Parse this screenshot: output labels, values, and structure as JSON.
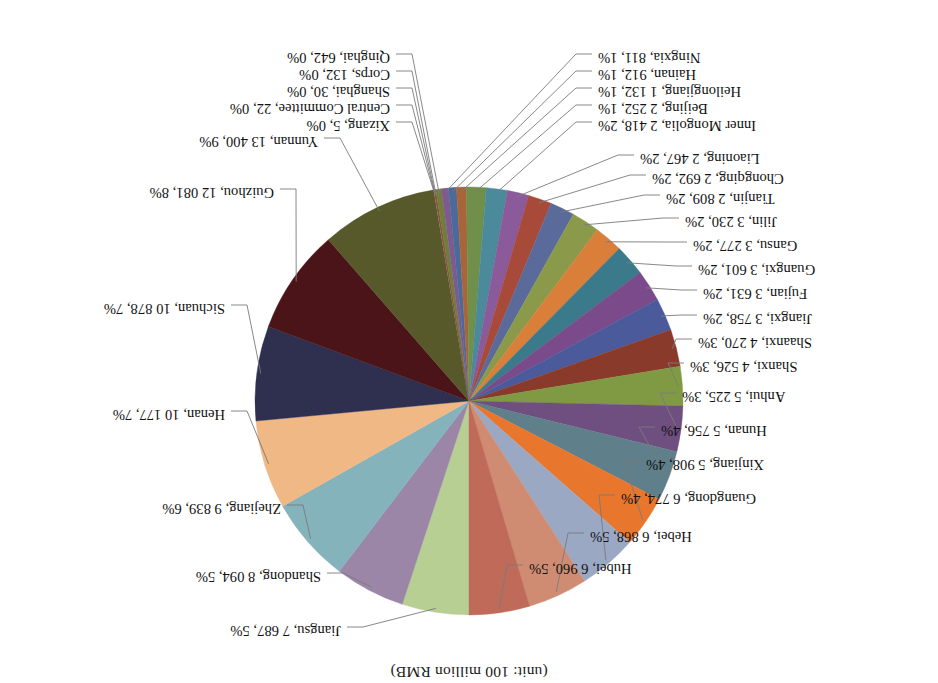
{
  "chart_data": {
    "type": "pie",
    "title": "(unit: 100 million RMB)",
    "xlabel": "",
    "ylabel": "",
    "legend_position": "none",
    "grid": false,
    "rotation_degrees": 180,
    "value_unit": "100 million RMB",
    "categories": [
      "Jiangsu",
      "Shandong",
      "Zhejiang",
      "Henan",
      "Sichuan",
      "Guizhou",
      "Yunnan",
      "Xizang",
      "Central Committee",
      "Shanghai",
      "Corps",
      "Qinghai",
      "Ningxia",
      "Hainan",
      "Heilongjiang",
      "Beijing",
      "Inner Mongolia",
      "Liaoning",
      "Chongqing",
      "Tianjin",
      "Jilin",
      "Gansu",
      "Guangxi",
      "Fujian",
      "Jiangxi",
      "Shaanxi",
      "Shanxi",
      "Anhui",
      "Hunan",
      "Xinjiang",
      "Guangdong",
      "Hebei",
      "Hubei"
    ],
    "values": [
      7687,
      8094,
      9839,
      10177,
      10878,
      12081,
      13400,
      5,
      22,
      30,
      132,
      642,
      811,
      912,
      1132,
      2252,
      2418,
      2467,
      2692,
      2809,
      3230,
      3277,
      3601,
      3631,
      3758,
      4270,
      4526,
      5225,
      5756,
      5908,
      6774,
      6868,
      6960
    ],
    "percents": [
      5,
      5,
      6,
      7,
      7,
      8,
      9,
      0,
      0,
      0,
      0,
      0,
      1,
      1,
      1,
      1,
      2,
      2,
      2,
      2,
      2,
      2,
      2,
      2,
      2,
      3,
      3,
      3,
      4,
      4,
      4,
      5,
      5
    ],
    "colors": [
      "#b8cf93",
      "#9b86a8",
      "#84b3bc",
      "#f0b884",
      "#2f3050",
      "#4a1418",
      "#57592a",
      "#8fb3c4",
      "#f0a64a",
      "#5a4a7a",
      "#a03c32",
      "#6f7f3a",
      "#7f5a8f",
      "#4a6a9a",
      "#a8653a",
      "#6f8f4a",
      "#4a8a9a",
      "#8a5a9a",
      "#a84a3a",
      "#5a6a9a",
      "#8a9a4a",
      "#d97f3a",
      "#3a7a8a",
      "#7a4a8a",
      "#4a5a9a",
      "#8a3a2a",
      "#7f9a42",
      "#6f4f7f",
      "#5f7f8a",
      "#e8762c",
      "#9aa8c4",
      "#d08c72",
      "#c06a5a"
    ],
    "labels": [
      {
        "name": "Jiangsu",
        "value": "7 687",
        "percent": "5%",
        "text": "Jiangsu, 7 687, 5%"
      },
      {
        "name": "Shandong",
        "value": "8 094",
        "percent": "5%",
        "text": "Shandong, 8 094, 5%"
      },
      {
        "name": "Zhejiang",
        "value": "9 839",
        "percent": "6%",
        "text": "Zhejiang, 9 839, 6%"
      },
      {
        "name": "Henan",
        "value": "10 177",
        "percent": "7%",
        "text": "Henan, 10 177, 7%"
      },
      {
        "name": "Sichuan",
        "value": "10 878",
        "percent": "7%",
        "text": "Sichuan, 10 878, 7%"
      },
      {
        "name": "Guizhou",
        "value": "12 081",
        "percent": "8%",
        "text": "Guizhou, 12 081, 8%"
      },
      {
        "name": "Yunnan",
        "value": "13 400",
        "percent": "9%",
        "text": "Yunnan, 13 400, 9%"
      },
      {
        "name": "Xizang",
        "value": "5",
        "percent": "0%",
        "text": "Xizang, 5, 0%"
      },
      {
        "name": "Central Committee",
        "value": "22",
        "percent": "0%",
        "text": "Central Committee, 22, 0%"
      },
      {
        "name": "Shanghai",
        "value": "30",
        "percent": "0%",
        "text": "Shanghai, 30, 0%"
      },
      {
        "name": "Corps",
        "value": "132",
        "percent": "0%",
        "text": "Corps, 132, 0%"
      },
      {
        "name": "Qinghai",
        "value": "642",
        "percent": "0%",
        "text": "Qinghai, 642, 0%"
      },
      {
        "name": "Ningxia",
        "value": "811",
        "percent": "1%",
        "text": "Ningxia, 811, 1%"
      },
      {
        "name": "Hainan",
        "value": "912",
        "percent": "1%",
        "text": "Hainan, 912, 1%"
      },
      {
        "name": "Heilongjiang",
        "value": "1 132",
        "percent": "1%",
        "text": "Heilongjiang, 1 132, 1%"
      },
      {
        "name": "Beijing",
        "value": "2 252",
        "percent": "1%",
        "text": "Beijing, 2 252, 1%"
      },
      {
        "name": "Inner Mongolia",
        "value": "2 418",
        "percent": "2%",
        "text": "Inner Mongolia, 2 418, 2%"
      },
      {
        "name": "Liaoning",
        "value": "2 467",
        "percent": "2%",
        "text": "Liaoning, 2 467, 2%"
      },
      {
        "name": "Chongqing",
        "value": "2 692",
        "percent": "2%",
        "text": "Chongqing, 2 692, 2%"
      },
      {
        "name": "Tianjin",
        "value": "2 809",
        "percent": "2%",
        "text": "Tianjin, 2 809, 2%"
      },
      {
        "name": "Jilin",
        "value": "3 230",
        "percent": "2%",
        "text": "Jilin, 3 230, 2%"
      },
      {
        "name": "Gansu",
        "value": "3 277",
        "percent": "2%",
        "text": "Gansu, 3 277, 2%"
      },
      {
        "name": "Guangxi",
        "value": "3 601",
        "percent": "2%",
        "text": "Guangxi, 3 601, 2%"
      },
      {
        "name": "Fujian",
        "value": "3 631",
        "percent": "2%",
        "text": "Fujian, 3 631, 2%"
      },
      {
        "name": "Jiangxi",
        "value": "3 758",
        "percent": "2%",
        "text": "Jiangxi, 3 758, 2%"
      },
      {
        "name": "Shaanxi",
        "value": "4 270",
        "percent": "3%",
        "text": "Shaanxi, 4 270, 3%"
      },
      {
        "name": "Shanxi",
        "value": "4 526",
        "percent": "3%",
        "text": "Shanxi, 4 526, 3%"
      },
      {
        "name": "Anhui",
        "value": "5 225",
        "percent": "3%",
        "text": "Anhui, 5 225, 3%"
      },
      {
        "name": "Hunan",
        "value": "5 756",
        "percent": "4%",
        "text": "Hunan, 5 756, 4%"
      },
      {
        "name": "Xinjiang",
        "value": "5 908",
        "percent": "4%",
        "text": "Xinjiang, 5 908, 4%"
      },
      {
        "name": "Guangdong",
        "value": "6 774",
        "percent": "4%",
        "text": "Guangdong, 6 774, 4%"
      },
      {
        "name": "Hebei",
        "value": "6 868",
        "percent": "5%",
        "text": "Hebei, 6 868, 5%"
      },
      {
        "name": "Hubei",
        "value": "6 960",
        "percent": "5%",
        "text": "Hubei, 6 960, 5%"
      }
    ]
  }
}
